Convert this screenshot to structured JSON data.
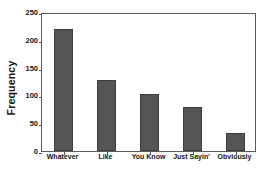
{
  "chart_data": {
    "type": "bar",
    "title": "",
    "subtitle": "",
    "xlabel": "",
    "ylabel": "Frequency",
    "categories": [
      "Whatever",
      "Like",
      "You Know",
      "Just Sayin'",
      "Obviously"
    ],
    "values": [
      219,
      127,
      102,
      79,
      33
    ],
    "ylim": [
      0,
      250
    ],
    "yticks": [
      0,
      50,
      100,
      150,
      200,
      250
    ],
    "ytick_labels": [
      "0",
      "50",
      "100",
      "150",
      "200",
      "250"
    ],
    "grid": false,
    "legend": null,
    "bar_color": "#555555",
    "bar_edge_color": "#3d3d3d",
    "axis_color": "#5a5a5a",
    "background_color": "#ffffff",
    "annotations": []
  }
}
